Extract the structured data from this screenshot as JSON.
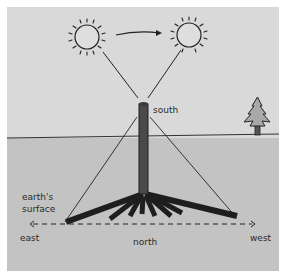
{
  "diagram": {
    "labels": {
      "pole_top": "south",
      "surface_line1": "earth's",
      "surface_line2": "surface",
      "left_direction": "east",
      "center_direction": "north",
      "right_direction": "west"
    },
    "icons": [
      "sun-icon",
      "sun-icon",
      "arrow-right-icon",
      "tree-icon"
    ],
    "colors": {
      "sky": "#d9d9d9",
      "ground": "#c3c3c3",
      "ink": "#1e1e1e",
      "pole": "#4a4a4a"
    }
  }
}
